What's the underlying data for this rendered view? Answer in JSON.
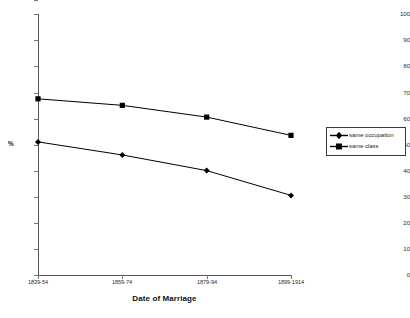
{
  "chart_data": {
    "type": "line",
    "title": "",
    "xlabel": "Date of Marriage",
    "ylabel": "%",
    "ylim": [
      0,
      100
    ],
    "ytick_step": 10,
    "yticks": [
      "100",
      "90",
      "80",
      "70",
      "60",
      "50",
      "40",
      "30",
      "20",
      "10",
      "0"
    ],
    "categories": [
      "1839-54",
      "1859-74",
      "1879-94",
      "1899-1914"
    ],
    "grid": false,
    "legend_position": "right",
    "series": [
      {
        "name": "same occupation",
        "marker": "diamond",
        "color": "#000000",
        "values": [
          51,
          46,
          40,
          30.5
        ]
      },
      {
        "name": "same class",
        "marker": "square",
        "color": "#000000",
        "values": [
          67.5,
          65,
          60.5,
          53.5
        ]
      }
    ]
  },
  "legend": {
    "entries": [
      {
        "label": "same occupation",
        "marker": "diamond-marker-icon"
      },
      {
        "label": "same class",
        "marker": "square-marker-icon"
      }
    ]
  }
}
